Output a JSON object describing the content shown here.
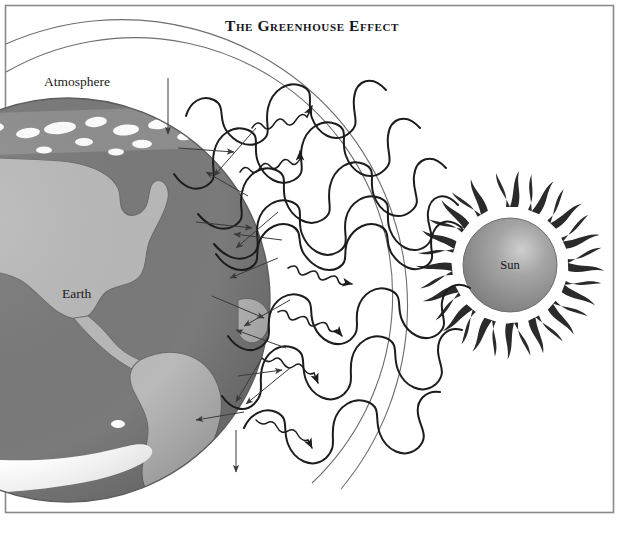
{
  "figure": {
    "title": "The Greenhouse Effect",
    "domain": "science-diagram",
    "background_color": "#ffffff",
    "border_color": "#8a8a8a",
    "labels": {
      "atmosphere": "Atmosphere",
      "earth": "Earth",
      "sun": "Sun"
    },
    "caption": "",
    "palette": {
      "ocean": "#7a7a7a",
      "land": "#b9b9b9",
      "ice": "#ffffff",
      "earth_outline": "#5d5d5d",
      "sun_body": "#8f8f8f",
      "sun_highlight": "#c9c9c9",
      "sun_flame": "#2a2a2a",
      "wave_stroke": "#1c1c1c",
      "arrow_stroke": "#3a3a3a",
      "atmosphere_arc": "#6e6e6e",
      "title_color": "#14141a"
    },
    "elements": {
      "earth_globe": "earth-globe",
      "atmosphere_band": "atmosphere-band",
      "sun_sphere": "sun-sphere",
      "solar_waves": "incoming-solar-radiation-waves",
      "infrared_squiggles": "outgoing-infrared-radiation",
      "reflection_arrows": "radiation-reflection-arrows"
    },
    "legend_semantics": [
      {
        "name": "incoming-solar-radiation",
        "description": "Large-amplitude waves travelling from Sun toward Earth"
      },
      {
        "name": "outgoing-infrared-radiation",
        "description": "Small tight squiggly arrows radiating away from Earth"
      },
      {
        "name": "trapped-radiation",
        "description": "Straight arrows bouncing between surface and atmosphere"
      }
    ]
  }
}
